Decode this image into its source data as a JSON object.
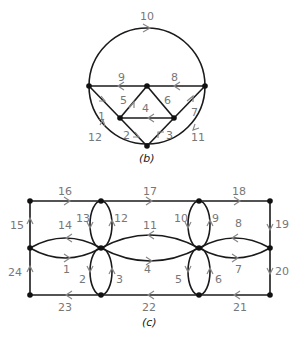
{
  "figure_b": {
    "caption": "(b)",
    "edge_labels": {
      "e1": "1",
      "e2": "2",
      "e3": "3",
      "e4": "4",
      "e5": "5",
      "e6": "6",
      "e7": "7",
      "e8": "8",
      "e9": "9",
      "e10": "10",
      "e11": "11",
      "e12": "12"
    }
  },
  "figure_c": {
    "caption": "(c)",
    "edge_labels": {
      "e1": "1",
      "e2": "2",
      "e3": "3",
      "e4": "4",
      "e5": "5",
      "e6": "6",
      "e7": "7",
      "e8": "8",
      "e9": "9",
      "e10": "10",
      "e11": "11",
      "e12": "12",
      "e13": "13",
      "e14": "14",
      "e15": "15",
      "e16": "16",
      "e17": "17",
      "e18": "18",
      "e19": "19",
      "e20": "20",
      "e21": "21",
      "e22": "22",
      "e23": "23",
      "e24": "24"
    }
  }
}
